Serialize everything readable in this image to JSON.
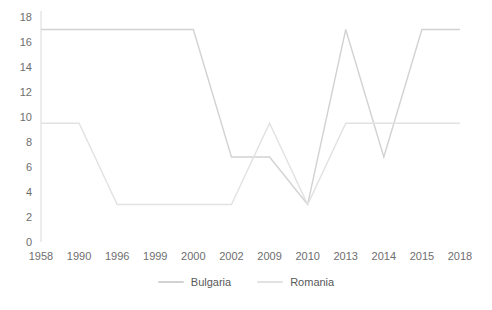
{
  "chart_data": {
    "type": "line",
    "title": "",
    "xlabel": "",
    "ylabel": "",
    "categories": [
      "1958",
      "1990",
      "1996",
      "1999",
      "2000",
      "2002",
      "2009",
      "2010",
      "2013",
      "2014",
      "2015",
      "2018"
    ],
    "y_ticks": [
      "0",
      "2",
      "4",
      "6",
      "8",
      "10",
      "12",
      "14",
      "16",
      "18"
    ],
    "ylim": [
      0,
      18
    ],
    "grid": false,
    "legend_position": "bottom",
    "series": [
      {
        "name": "Bulgaria",
        "color": "#d2d2d2",
        "values": [
          17,
          17,
          17,
          17,
          17,
          6.8,
          6.8,
          3,
          17,
          6.8,
          17,
          17
        ]
      },
      {
        "name": "Romania",
        "color": "#e2e2e2",
        "values": [
          9.5,
          9.5,
          3,
          3,
          3,
          3,
          9.5,
          3,
          9.5,
          9.5,
          9.5,
          9.5
        ]
      }
    ]
  },
  "caption": {
    "text": ""
  }
}
